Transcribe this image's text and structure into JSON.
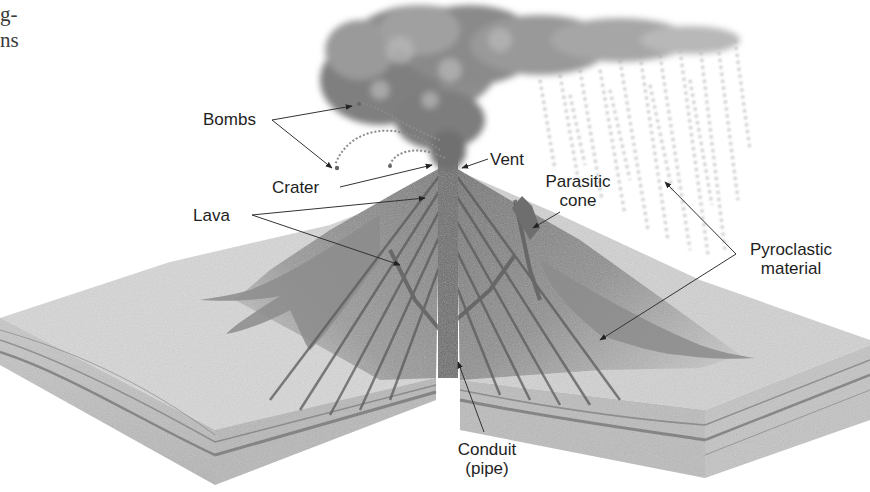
{
  "figure": {
    "cutoff_text": [
      "g-",
      "ns"
    ],
    "labels": {
      "bombs": "Bombs",
      "crater": "Crater",
      "lava": "Lava",
      "vent": "Vent",
      "parasitic_line1": "Parasitic",
      "parasitic_line2": "cone",
      "pyro_line1": "Pyroclastic",
      "pyro_line2": "material",
      "conduit_line1": "Conduit",
      "conduit_line2": "(pipe)"
    },
    "colors": {
      "background": "#ffffff",
      "text": "#1e1e1e",
      "cone_dark": "#7d7d7d",
      "cone_mid": "#a4a4a4",
      "ground_light": "#d9d9d9",
      "ash_cloud": "#8a8a8a",
      "leader_line": "#333333"
    }
  }
}
